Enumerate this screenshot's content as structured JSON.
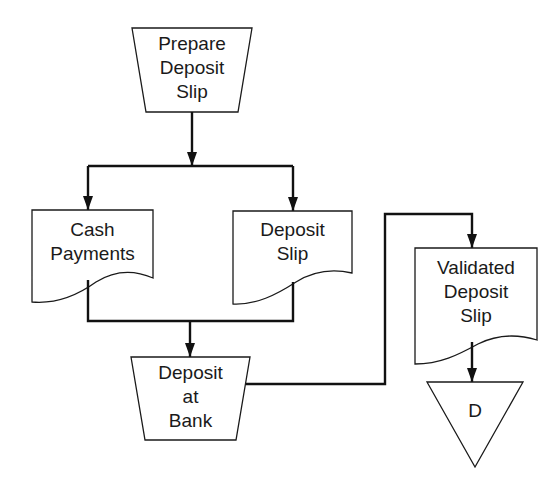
{
  "diagram": {
    "type": "flowchart",
    "nodes": {
      "prepare": {
        "shape": "manual-operation",
        "lines": [
          "Prepare",
          "Deposit",
          "Slip"
        ]
      },
      "cash": {
        "shape": "document",
        "lines": [
          "Cash",
          "Payments"
        ]
      },
      "slip": {
        "shape": "document",
        "lines": [
          "Deposit",
          "Slip"
        ]
      },
      "bank": {
        "shape": "manual-operation",
        "lines": [
          "Deposit",
          "at",
          "Bank"
        ]
      },
      "validated": {
        "shape": "document",
        "lines": [
          "Validated",
          "Deposit",
          "Slip"
        ]
      },
      "file": {
        "shape": "offline-storage",
        "lines": [
          "D"
        ]
      }
    },
    "edges": [
      {
        "from": "Prepare Deposit Slip",
        "to": "Cash Payments"
      },
      {
        "from": "Prepare Deposit Slip",
        "to": "Deposit Slip"
      },
      {
        "from": "Cash Payments",
        "to": "Deposit at Bank"
      },
      {
        "from": "Deposit Slip",
        "to": "Deposit at Bank"
      },
      {
        "from": "Deposit at Bank",
        "to": "Validated Deposit Slip"
      },
      {
        "from": "Validated Deposit Slip",
        "to": "D"
      }
    ],
    "colors": {
      "stroke": "#1a1a1a",
      "background": "#ffffff"
    }
  }
}
